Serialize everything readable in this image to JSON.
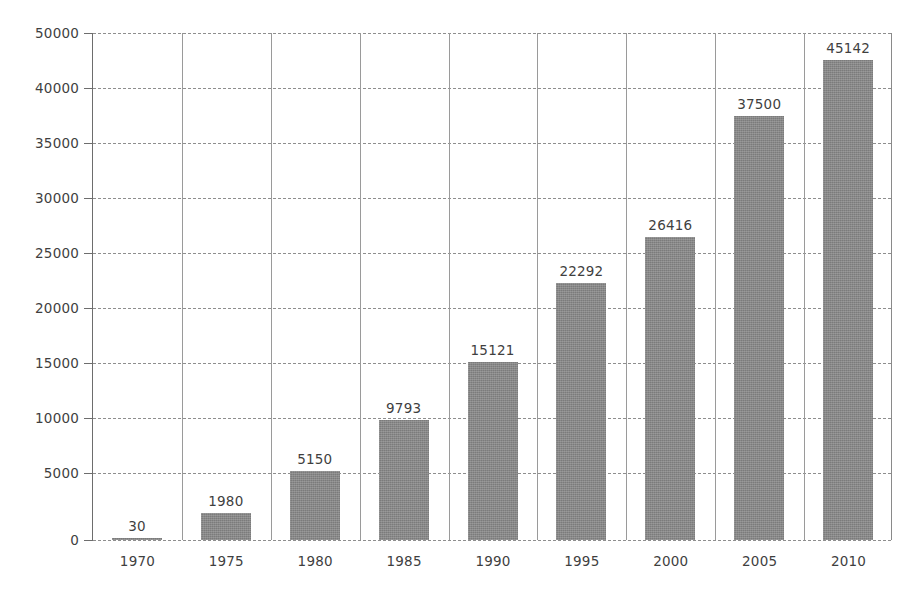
{
  "chart": {
    "title_ghost": "",
    "background_color": "#ffffff",
    "bar_color": "#7b7b7b",
    "grid_color": "#8e8e8e",
    "axis_color": "#6d6d6d",
    "text_color": "#3f3f3f"
  },
  "chart_data": {
    "type": "bar",
    "title": "",
    "xlabel": "",
    "ylabel": "",
    "categories": [
      "1970",
      "1975",
      "1980",
      "1985",
      "1990",
      "1995",
      "2000",
      "2005",
      "2010"
    ],
    "values": [
      30,
      1980,
      5150,
      9793,
      15121,
      22292,
      26416,
      37500,
      45142
    ],
    "value_labels": [
      "30",
      "1980",
      "5150",
      "9793",
      "15121",
      "22292",
      "26416",
      "37500",
      "45142"
    ],
    "ylim": [
      0,
      50000
    ],
    "ytick_labels": [
      "50000",
      "40000",
      "35000",
      "30000",
      "25000",
      "20000",
      "15000",
      "10000",
      "5000",
      "0"
    ],
    "ytick_values": [
      50000,
      40000,
      35000,
      30000,
      25000,
      20000,
      15000,
      10000,
      5000,
      0
    ],
    "grid": "horizontal-dashed-and-vertical-solid",
    "legend": "none",
    "legend_position": "none",
    "series": [
      {
        "name": "",
        "values": [
          30,
          1980,
          5150,
          9793,
          15121,
          22292,
          26416,
          37500,
          45142
        ]
      }
    ]
  }
}
